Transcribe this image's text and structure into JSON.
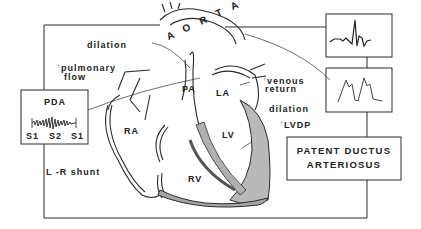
{
  "diagram": {
    "title": "PATENT DUCTUS ARTERIOSUS",
    "title_lines": [
      "PATENT DUCTUS",
      "ARTERIOSUS"
    ],
    "structures": {
      "aorta": "A O R T A",
      "pa": "PA",
      "la": "LA",
      "lv": "LV",
      "ra": "RA",
      "rv": "RV"
    },
    "annotations": {
      "dilation_aorta": "dilation",
      "pulmonary_flow_arrow": "↑",
      "pulmonary_flow_line1": "pulmonary",
      "pulmonary_flow_line2": "flow",
      "venous_return_arrow": "↑",
      "venous_return_line1": "venous",
      "venous_return_line2": "return",
      "dilation_lv": "dilation",
      "lvdp_arrow": "↑",
      "lvdp": "LVDP",
      "shunt": "L -R  shunt"
    },
    "pda_murmur_box": {
      "title": "PDA",
      "sounds": [
        "S1",
        "S2",
        "S1"
      ]
    },
    "inset_boxes": [
      {
        "name": "ecg",
        "content": "ECG waveform"
      },
      {
        "name": "arterial-pulse",
        "content": "bounding pulse waveform"
      }
    ],
    "colors": {
      "line": "#2a2a2a",
      "background": "#ffffff"
    }
  }
}
